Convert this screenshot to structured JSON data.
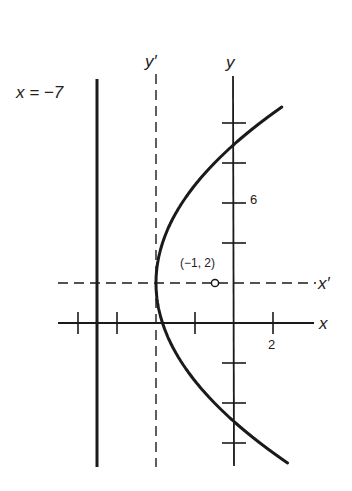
{
  "diagram": {
    "type": "parabola-translation-of-axes",
    "equation_implied": "(y-2)^2 = 12(x+4)",
    "colors": {
      "ink": "#1a1a1a",
      "background": "#ffffff"
    },
    "labels": {
      "directrix": "x = −7",
      "y_prime_axis": "y′",
      "y_axis": "y",
      "x_axis": "x",
      "x_prime_axis": "x′",
      "focus_point": "(−1, 2)",
      "y_tick_6": "6",
      "x_tick_2": "2"
    },
    "focus": {
      "x": -1,
      "y": 2
    },
    "vertex": {
      "x": -4,
      "y": 2
    },
    "directrix_x": -7,
    "x_ticks": [
      -8,
      -6,
      -2,
      2
    ],
    "y_ticks": [
      10,
      8,
      6,
      4,
      -2,
      -4,
      -6
    ],
    "curve_y_range": [
      -7,
      10.8
    ]
  }
}
